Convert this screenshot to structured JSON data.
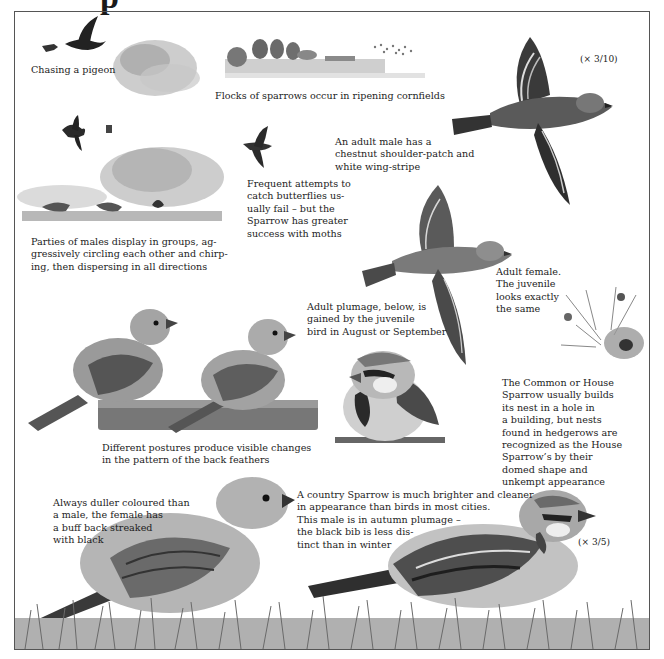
{
  "page": {
    "title_fragment": "p",
    "scales": {
      "flying_male": "(× 3/10)",
      "bottom_male": "(× 3/5)"
    },
    "captions": {
      "chasing_pigeon": "Chasing a pigeon",
      "flocks_cornfields": "Flocks of sparrows occur in ripening cornfields",
      "adult_male_flight": [
        "An adult male has a",
        "chestnut shoulder-patch and",
        "white wing-stripe"
      ],
      "butterflies": [
        "Frequent attempts to",
        "catch butterflies us-",
        "ually fail – but the",
        "Sparrow has greater",
        "success with moths"
      ],
      "parties_of_males": [
        "Parties of males display in groups, ag-",
        "gressively circling each other and chirp-",
        "ing, then dispersing in all directions"
      ],
      "adult_female_flight": [
        "Adult female.",
        "The juvenile",
        "looks exactly",
        "the same"
      ],
      "adult_plumage": [
        "Adult plumage, below, is",
        "gained by the juvenile",
        "bird in August or September"
      ],
      "nest": [
        "The Common or House",
        "Sparrow usually builds",
        "its nest in a hole in",
        "a building, but nests",
        "found in hedgerows are",
        "recognized as the House",
        "Sparrow’s by their",
        "domed shape and",
        "unkempt appearance"
      ],
      "postures": [
        "Different postures produce visible changes",
        "in the pattern of the back feathers"
      ],
      "duller_female": [
        "Always duller coloured than",
        "a male, the female has",
        "a buff back streaked",
        "with black"
      ],
      "country_sparrow": [
        "A country Sparrow is much brighter and cleaner",
        "in appearance than birds in most cities.",
        "This male is in autumn plumage –",
        "the black bib is less dis-",
        "tinct than in winter"
      ]
    },
    "illustrations": [
      "sparrow-chasing-pigeon",
      "flock-over-bushes",
      "cornfield-landscape",
      "flying-adult-male",
      "sparrow-chasing-butterfly",
      "males-displaying-on-ground",
      "flying-adult-female",
      "juvenile-sparrows-perched",
      "male-sparrow-perched",
      "nest-in-hedgerow",
      "female-sparrow-on-grass",
      "country-male-on-grass"
    ],
    "colors": {
      "ink": "#1c1c1c",
      "frame": "#555555",
      "bird_dark": "#2e2e2e",
      "bird_mid": "#8a8a8a",
      "bird_light": "#d6d6d6",
      "foliage": "#a8a8a8"
    }
  }
}
